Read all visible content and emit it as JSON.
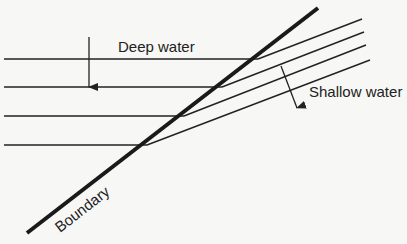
{
  "diagram": {
    "labels": {
      "deep": "Deep water",
      "shallow": "Shallow water",
      "boundary": "Boundary"
    },
    "colors": {
      "background": "#f7f7f5",
      "line": "#222222"
    }
  }
}
